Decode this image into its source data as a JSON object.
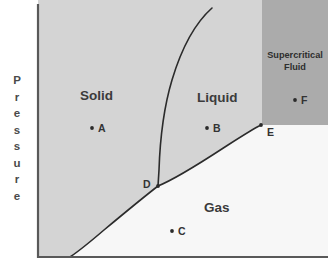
{
  "figure": {
    "type": "phase-diagram",
    "y_axis_label_letters": [
      "P",
      "r",
      "e",
      "s",
      "s",
      "u",
      "r",
      "e"
    ],
    "y_axis_label": "Pressure"
  },
  "regions": [
    {
      "key": "solid",
      "label": "Solid",
      "x": 80,
      "y": 88,
      "fill": "#d4d4d4"
    },
    {
      "key": "liquid",
      "label": "Liquid",
      "x": 197,
      "y": 90,
      "fill": "#d4d4d4"
    },
    {
      "key": "gas",
      "label": "Gas",
      "x": 204,
      "y": 200,
      "fill": "#f7f7f7"
    },
    {
      "key": "supercritical",
      "label_line1": "Supercritical",
      "label_line2": "Fluid",
      "x": 265,
      "y": 50,
      "fill": "#ababab"
    }
  ],
  "points": [
    {
      "id": "A",
      "label": "A",
      "dot_x": 92,
      "dot_y": 128,
      "label_x": 98,
      "label_y": 122
    },
    {
      "id": "B",
      "label": "B",
      "dot_x": 207,
      "dot_y": 128,
      "label_x": 213,
      "label_y": 122
    },
    {
      "id": "C",
      "label": "C",
      "dot_x": 172,
      "dot_y": 231,
      "label_x": 178,
      "label_y": 225
    },
    {
      "id": "D",
      "label": "D",
      "dot_x": 158,
      "dot_y": 186,
      "label_x": 143,
      "label_y": 178
    },
    {
      "id": "E",
      "label": "E",
      "dot_x": 261,
      "dot_y": 125,
      "label_x": 267,
      "label_y": 126
    },
    {
      "id": "F",
      "label": "F",
      "dot_x": 295,
      "dot_y": 100,
      "label_x": 301,
      "label_y": 94
    }
  ],
  "curves": {
    "fusion": {
      "name": "solid-liquid-boundary",
      "path": "M 158 186 L 159 170 C 160 140 163 110 172 80 C 181 50 194 24 212 8",
      "color": "#2b2b2b",
      "width": 1.6
    },
    "vaporization": {
      "name": "liquid-gas-boundary",
      "path": "M 158 186 C 178 178 205 160 228 145 C 242 136 253 129 261 125",
      "color": "#2b2b2b",
      "width": 1.6
    },
    "sublimation": {
      "name": "solid-gas-boundary",
      "path": "M 158 186 C 140 200 122 215 104 230 C 90 242 79 251 70 257",
      "color": "#2b2b2b",
      "width": 1.6
    }
  },
  "axes": {
    "vertical": {
      "x": 38,
      "y_top": 4,
      "y_bottom": 258
    },
    "horizontal": {
      "y": 257,
      "x_left": 38,
      "x_right": 328
    },
    "color": "#595959",
    "width": 2.2
  },
  "geometry": {
    "plot_left": 38,
    "plot_top": 0,
    "plot_right": 328,
    "plot_bottom": 257,
    "supercritical_rect": {
      "x": 262,
      "y": 0,
      "w": 66,
      "h": 125
    }
  },
  "colors": {
    "condensed_fill": "#d4d4d4",
    "gas_fill": "#f7f7f7",
    "supercritical_fill": "#ababab",
    "curve": "#2b2b2b",
    "axis": "#595959",
    "page_background": "#ffffff"
  }
}
